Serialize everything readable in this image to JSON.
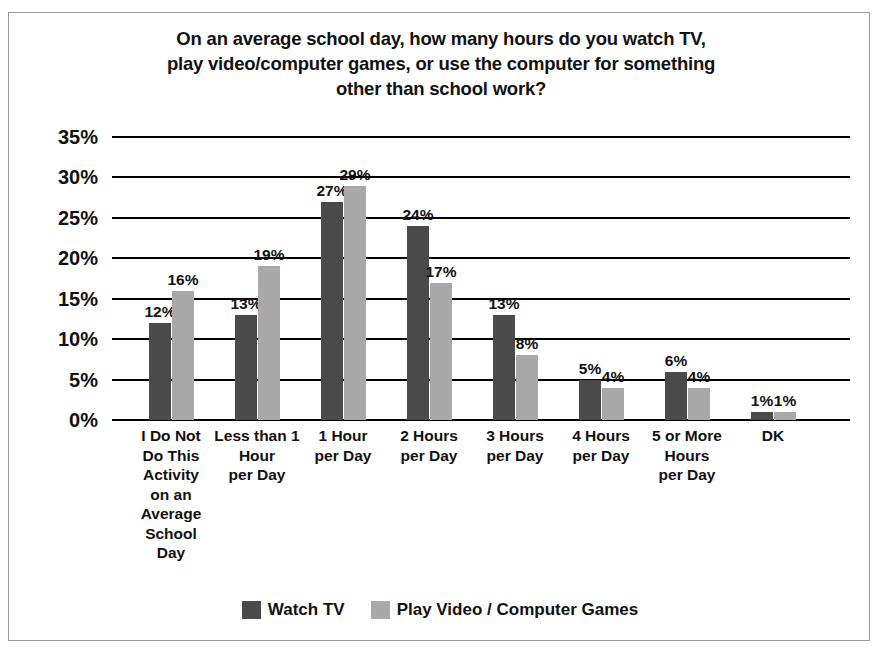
{
  "chart_data": {
    "type": "bar",
    "title": "On an average school day, how many hours do you watch TV, play video/computer games, or use the computer for something other than school work?",
    "title_lines": [
      "On an average school day, how many hours do you watch TV,",
      "play video/computer games, or use the computer for something",
      "other than school work?"
    ],
    "categories": [
      "I Do Not Do This Activity on an Average School Day",
      "Less than 1 Hour per Day",
      "1 Hour per Day",
      "2 Hours per Day",
      "3 Hours per Day",
      "4 Hours per Day",
      "5 or More Hours per Day",
      "DK"
    ],
    "category_lines": [
      [
        "I Do Not",
        "Do This",
        "Activity",
        "on an",
        "Average",
        "School",
        "Day"
      ],
      [
        "Less than 1",
        "Hour",
        "per Day"
      ],
      [
        "1 Hour",
        "per Day"
      ],
      [
        "2 Hours",
        "per Day"
      ],
      [
        "3 Hours",
        "per Day"
      ],
      [
        "4 Hours",
        "per Day"
      ],
      [
        "5 or More",
        "Hours",
        "per Day"
      ],
      [
        "DK"
      ]
    ],
    "series": [
      {
        "name": "Watch TV",
        "color": "#4a4a4a",
        "values": [
          12,
          13,
          27,
          24,
          13,
          5,
          6,
          1
        ],
        "labels": [
          "12%",
          "13%",
          "27%",
          "24%",
          "13%",
          "5%",
          "6%",
          "1%"
        ]
      },
      {
        "name": "Play Video / Computer Games",
        "color": "#a9a9a9",
        "values": [
          16,
          19,
          29,
          17,
          8,
          4,
          4,
          1
        ],
        "labels": [
          "16%",
          "19%",
          "29%",
          "17%",
          "8%",
          "4%",
          "4%",
          "1%"
        ]
      }
    ],
    "xlabel": "",
    "ylabel": "",
    "ylim": [
      0,
      35
    ],
    "yticks": [
      0,
      5,
      10,
      15,
      20,
      25,
      30,
      35
    ],
    "ytick_labels": [
      "0%",
      "5%",
      "10%",
      "15%",
      "20%",
      "25%",
      "30%",
      "35%"
    ],
    "grid": true,
    "grid_color": "#000000",
    "legend_position": "bottom",
    "value_suffix": "%"
  }
}
